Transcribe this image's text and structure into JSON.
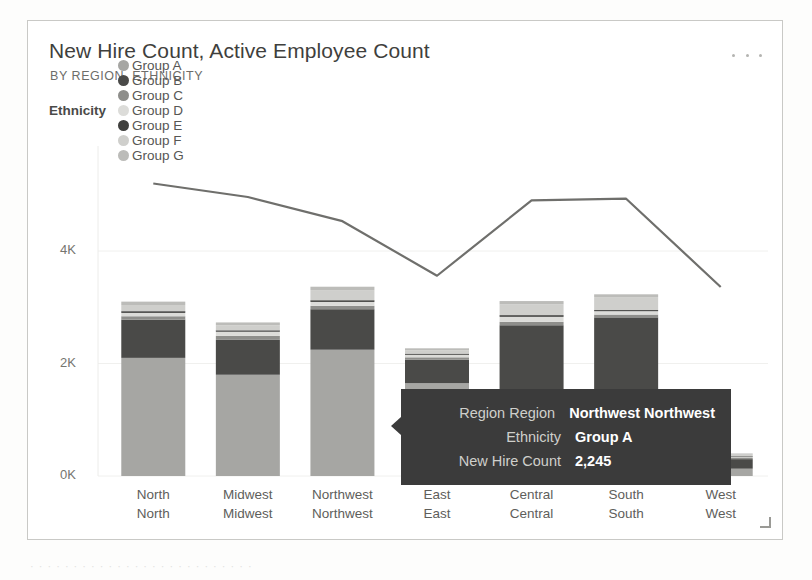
{
  "card": {
    "title": "New Hire Count, Active Employee Count",
    "subtitle": "BY REGION, ETHNICITY",
    "menu_icon": "ellipsis-icon",
    "resize_icon": "resize-handle-icon"
  },
  "legend": {
    "title": "Ethnicity",
    "items": [
      {
        "label": "Group A",
        "color": "#a6a6a3"
      },
      {
        "label": "Group B",
        "color": "#4a4a48"
      },
      {
        "label": "Group C",
        "color": "#8e8e8b"
      },
      {
        "label": "Group D",
        "color": "#dcdcd9"
      },
      {
        "label": "Group E",
        "color": "#3f3f3d"
      },
      {
        "label": "Group F",
        "color": "#cfcfcc"
      },
      {
        "label": "Group G",
        "color": "#bcbcb9"
      }
    ]
  },
  "tooltip": {
    "rows": [
      {
        "key": "Region Region",
        "value": "Northwest Northwest"
      },
      {
        "key": "Ethnicity",
        "value": "Group A"
      },
      {
        "key": "New Hire Count",
        "value": "2,245"
      }
    ]
  },
  "chart_data": {
    "type": "bar",
    "title": "New Hire Count, Active Employee Count",
    "subtitle": "BY REGION, ETHNICITY",
    "xlabel": "",
    "ylabel": "",
    "stacked": true,
    "grid": true,
    "legend_position": "top",
    "ylim": [
      0,
      4800
    ],
    "ytick_labels": [
      "0K",
      "2K",
      "4K"
    ],
    "ytick_values": [
      0,
      2000,
      4000
    ],
    "categories": [
      "North North",
      "Midwest Midwest",
      "Northwest Northwest",
      "East East",
      "Central Central",
      "South South",
      "West West"
    ],
    "series": [
      {
        "name": "Group A",
        "color": "#a6a6a3",
        "values": [
          2100,
          1800,
          2245,
          1650,
          1500,
          120,
          130
        ]
      },
      {
        "name": "Group B",
        "color": "#4a4a48",
        "values": [
          680,
          620,
          720,
          420,
          1180,
          2700,
          170
        ]
      },
      {
        "name": "Group C",
        "color": "#8e8e8b",
        "values": [
          60,
          70,
          60,
          40,
          60,
          50,
          20
        ]
      },
      {
        "name": "Group D",
        "color": "#dcdcd9",
        "values": [
          60,
          75,
          70,
          45,
          90,
          60,
          20
        ]
      },
      {
        "name": "Group E",
        "color": "#3f3f3d",
        "values": [
          30,
          25,
          30,
          20,
          30,
          20,
          10
        ]
      },
      {
        "name": "Group F",
        "color": "#cfcfcc",
        "values": [
          110,
          90,
          180,
          60,
          190,
          230,
          30
        ]
      },
      {
        "name": "Group G",
        "color": "#bcbcb9",
        "values": [
          60,
          50,
          60,
          35,
          60,
          50,
          20
        ]
      }
    ],
    "line_series": {
      "name": "Active Employee Count",
      "color": "#6f6f6c",
      "values": [
        5200,
        4960,
        4530,
        3560,
        4900,
        4930,
        3360
      ]
    }
  },
  "page_artifact": "· · · · · · · · · · · · · · · · · · · · · · · · · ·"
}
